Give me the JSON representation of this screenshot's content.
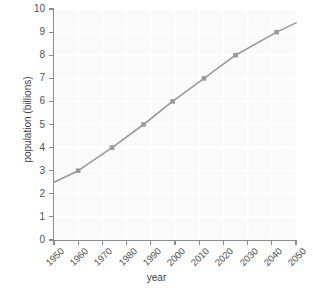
{
  "chart_data": {
    "type": "line",
    "title": "",
    "xlabel": "year",
    "ylabel": "population (billions)",
    "xlim": [
      1950,
      2050
    ],
    "ylim": [
      0,
      10
    ],
    "grid": true,
    "legend": null,
    "xticks": [
      1950,
      1960,
      1970,
      1980,
      1990,
      2000,
      2010,
      2020,
      2030,
      2040,
      2050
    ],
    "xtick_labels": [
      "1950",
      "1960",
      "1970",
      "1980",
      "1990",
      "2000",
      "2010",
      "2020",
      "2030",
      "2040",
      "2050"
    ],
    "yticks": [
      0,
      1,
      2,
      3,
      4,
      5,
      6,
      7,
      8,
      9,
      10
    ],
    "ytick_labels": [
      "0",
      "1",
      "2",
      "3",
      "4",
      "5",
      "6",
      "7",
      "8",
      "9",
      "10"
    ],
    "series": [
      {
        "name": "world population",
        "color": "#9a9a9a",
        "marker": "square",
        "marker_color": "#9a9a9a",
        "x": [
          1950,
          1960,
          1974,
          1987,
          1999,
          2012,
          2025,
          2042,
          2050
        ],
        "y": [
          2.5,
          3.0,
          4.0,
          5.0,
          6.0,
          7.0,
          8.0,
          9.0,
          9.4
        ],
        "marker_points": [
          {
            "x": 1960,
            "y": 3.0
          },
          {
            "x": 1974,
            "y": 4.0
          },
          {
            "x": 1987,
            "y": 5.0
          },
          {
            "x": 1999,
            "y": 6.0
          },
          {
            "x": 2012,
            "y": 7.0
          },
          {
            "x": 2025,
            "y": 8.0
          },
          {
            "x": 2042,
            "y": 9.0
          }
        ]
      }
    ],
    "colors": {
      "line": "#9a9a9a",
      "axis": "#8c8c8c",
      "grid": "#ffffff",
      "plot_background": "#fafafa",
      "figure_background": "#ffffff",
      "text": "#4f4f4f"
    }
  }
}
